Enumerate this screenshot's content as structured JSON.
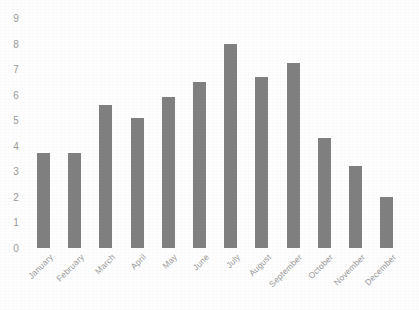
{
  "chart_data": {
    "type": "bar",
    "title": "",
    "xlabel": "",
    "ylabel": "",
    "categories": [
      "January",
      "February",
      "March",
      "April",
      "May",
      "June",
      "July",
      "August",
      "September",
      "October",
      "November",
      "December"
    ],
    "values": [
      3.7,
      3.7,
      5.6,
      5.1,
      5.9,
      6.5,
      8.0,
      6.7,
      7.25,
      4.3,
      3.2,
      2.0
    ],
    "ylim": [
      0,
      9
    ],
    "ytick_labels": [
      "0",
      "1",
      "2",
      "3",
      "4",
      "5",
      "6",
      "7",
      "8",
      "9"
    ],
    "ytick_values": [
      0,
      1,
      2,
      3,
      4,
      5,
      6,
      7,
      8,
      9
    ],
    "grid": false,
    "legend": false,
    "bar_color": "#808080",
    "axis_text_color": "#9a9a9a",
    "background_color": "#ffffff",
    "xtick_label_rotation": -45
  }
}
